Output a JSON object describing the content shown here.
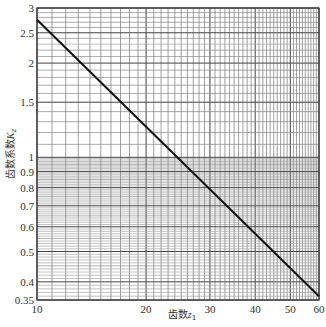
{
  "chart_data": {
    "type": "line",
    "title": "",
    "xlabel": "齿数z₁",
    "ylabel": "齿数系数K_z",
    "x_scale": "log",
    "y_scale": "log",
    "xlim": [
      10,
      60
    ],
    "ylim": [
      0.35,
      3
    ],
    "x_ticks": [
      10,
      20,
      30,
      40,
      50,
      60
    ],
    "x_tick_labels": [
      "10",
      "20",
      "30",
      "40",
      "50",
      "60"
    ],
    "y_ticks": [
      0.35,
      0.4,
      0.5,
      0.6,
      0.7,
      0.8,
      0.9,
      1,
      1.5,
      2,
      2.5,
      3
    ],
    "y_tick_labels": [
      "0.35",
      "0.4",
      "0.5",
      "0.6",
      "0.7",
      "0.8",
      "0.9",
      "1",
      "1.5",
      "2",
      "2.5",
      "3"
    ],
    "grid": true,
    "legend": null,
    "series": [
      {
        "name": "K_z",
        "x": [
          10,
          15,
          20,
          25,
          30,
          40,
          50,
          60
        ],
        "y": [
          2.75,
          1.84,
          1.38,
          1.11,
          0.92,
          0.69,
          0.55,
          0.36
        ]
      }
    ],
    "line_color": "#111111",
    "grid_color": "#555555"
  },
  "axes": {
    "x_title": "齿数",
    "x_title_var": "z",
    "x_title_sub": "1",
    "y_title": "齿数系数",
    "y_title_var": "K",
    "y_title_sub": "z"
  }
}
